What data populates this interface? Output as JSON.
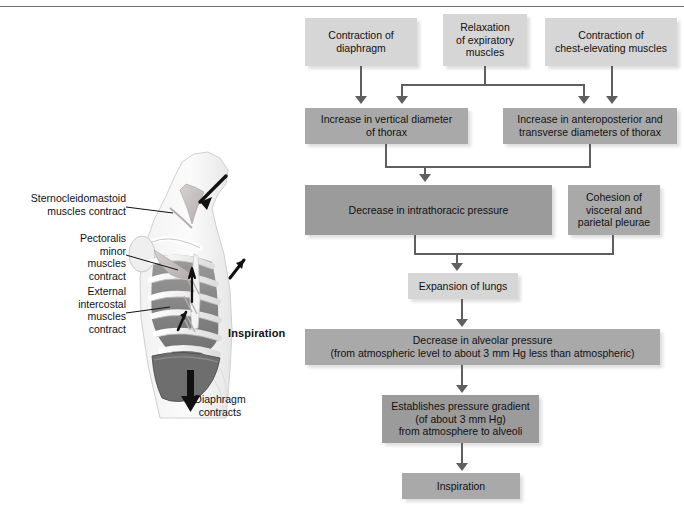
{
  "header": {
    "cropped_text": ""
  },
  "illustration": {
    "title": "Inspiration",
    "labels": [
      {
        "name": "sternocleidomastoid",
        "text": "Sternocleidomastoid\nmuscles contract"
      },
      {
        "name": "pectoralis-minor",
        "text": "Pectoralis\nminor\nmuscles\ncontract"
      },
      {
        "name": "external-intercostal",
        "text": "External\nintercostal\nmuscles\ncontract"
      },
      {
        "name": "diaphragm",
        "text": "Diaphragm\ncontracts"
      }
    ]
  },
  "flowchart": {
    "nodes": {
      "contraction_diaphragm": "Contraction of\ndiaphragm",
      "relaxation_expiratory": "Relaxation\nof expiratory\nmuscles",
      "contraction_chest": "Contraction of\nchest-elevating muscles",
      "vertical_diameter": "Increase in vertical diameter\nof thorax",
      "anteroposterior": "Increase in anteroposterior and\ntransverse diameters of thorax",
      "intrathoracic_pressure": "Decrease in intrathoracic pressure",
      "cohesion_pleurae": "Cohesion of\nvisceral and\nparietal pleurae",
      "expansion_lungs": "Expansion of lungs",
      "alveolar_pressure": "Decrease in alveolar pressure\n(from atmospheric level to about 3 mm Hg less than atmospheric)",
      "pressure_gradient": "Establishes pressure gradient\n(of about 3 mm Hg)\nfrom atmosphere to alveoli",
      "inspiration": "Inspiration"
    }
  },
  "colors": {
    "tone_light": "#d6d6d6",
    "tone_mid": "#a9a9a9",
    "tone_dark": "#9b9b9b",
    "connector": "#5f5f5f",
    "text": "#111111"
  }
}
